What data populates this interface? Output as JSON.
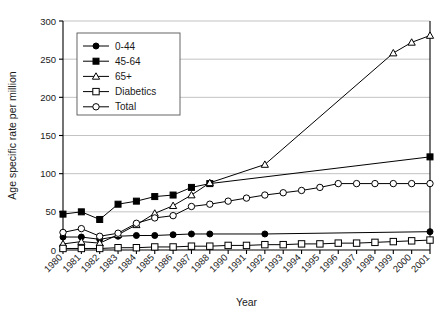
{
  "chart_data": {
    "type": "line",
    "title": "",
    "xlabel": "Year",
    "ylabel": "Age specific rate per million",
    "ylim": [
      0,
      300
    ],
    "yticks": [
      0,
      50,
      100,
      150,
      200,
      250,
      300
    ],
    "grid": true,
    "legend_position": "top-left",
    "categories": [
      "1980",
      "1981",
      "1982",
      "1983",
      "1984",
      "1985",
      "1986",
      "1987",
      "1988",
      "1990",
      "1991",
      "1992",
      "1993",
      "1994",
      "1995",
      "1996",
      "1997",
      "1998",
      "1999",
      "2000",
      "2001"
    ],
    "series": [
      {
        "name": "0-44",
        "marker": "filled-circle",
        "values": [
          17,
          17,
          14,
          18,
          19,
          19,
          20,
          21,
          21,
          null,
          null,
          21,
          null,
          null,
          null,
          null,
          null,
          null,
          null,
          null,
          24
        ]
      },
      {
        "name": "45-64",
        "marker": "filled-square",
        "values": [
          47,
          50,
          40,
          60,
          64,
          70,
          72,
          82,
          87,
          null,
          null,
          null,
          null,
          null,
          null,
          null,
          null,
          null,
          null,
          null,
          122
        ]
      },
      {
        "name": "65+",
        "marker": "open-triangle",
        "values": [
          8,
          11,
          9,
          20,
          33,
          48,
          58,
          72,
          88,
          null,
          null,
          112,
          null,
          null,
          null,
          null,
          null,
          null,
          258,
          272,
          281
        ]
      },
      {
        "name": "Diabetics",
        "marker": "open-square",
        "values": [
          2,
          2,
          2,
          3,
          3,
          4,
          4,
          5,
          5,
          6,
          6,
          7,
          7,
          8,
          8,
          9,
          9,
          10,
          11,
          12,
          13
        ]
      },
      {
        "name": "Total",
        "marker": "open-circle",
        "values": [
          23,
          28,
          18,
          22,
          35,
          42,
          45,
          57,
          60,
          64,
          68,
          72,
          75,
          78,
          82,
          87,
          87,
          87,
          87,
          87,
          87
        ]
      }
    ]
  },
  "legend": {
    "items": [
      {
        "label": "0-44"
      },
      {
        "label": "45-64"
      },
      {
        "label": "65+"
      },
      {
        "label": "Diabetics"
      },
      {
        "label": "Total"
      }
    ]
  },
  "colors": {
    "line": "#000000",
    "grid": "#b4b4b4",
    "axis": "#000000",
    "marker_fill_open": "#ffffff"
  }
}
